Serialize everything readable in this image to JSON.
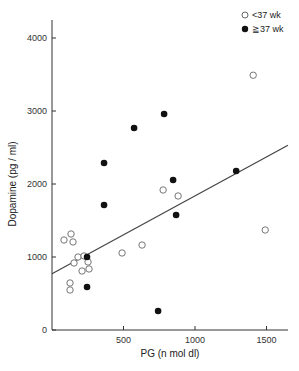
{
  "chart_data": {
    "type": "scatter",
    "title": "",
    "xlabel": "PG (n mol dl)",
    "ylabel": "Dopamine (pg / ml)",
    "xlim": [
      0,
      1650
    ],
    "ylim": [
      0,
      4300
    ],
    "xticks": [
      500,
      1000,
      1500
    ],
    "yticks": [
      0,
      1000,
      2000,
      3000,
      4000
    ],
    "grid": false,
    "legend_position": "top-right",
    "series": [
      {
        "name": "<37 wk",
        "marker": "open-circle",
        "points": [
          [
            1407,
            3490
          ],
          [
            777,
            1918
          ],
          [
            882,
            1836
          ],
          [
            630,
            1164
          ],
          [
            1491,
            1370
          ],
          [
            490,
            1055
          ],
          [
            84,
            1233
          ],
          [
            133,
            1315
          ],
          [
            147,
            1206
          ],
          [
            182,
            1000
          ],
          [
            154,
            918
          ],
          [
            224,
            1014
          ],
          [
            210,
            808
          ],
          [
            126,
            644
          ],
          [
            126,
            548
          ],
          [
            259,
            836
          ],
          [
            252,
            932
          ]
        ]
      },
      {
        "name": "≧37 wk",
        "marker": "filled-circle",
        "points": [
          [
            784,
            2959
          ],
          [
            574,
            2767
          ],
          [
            364,
            2288
          ],
          [
            847,
            2055
          ],
          [
            364,
            1712
          ],
          [
            868,
            1575
          ],
          [
            1288,
            2178
          ],
          [
            245,
            1000
          ],
          [
            245,
            589
          ],
          [
            742,
            260
          ]
        ]
      }
    ],
    "regression_line": {
      "x": [
        0,
        1650
      ],
      "y": [
        770,
        2530
      ]
    }
  },
  "legend": {
    "items": [
      {
        "label": "<37 wk",
        "marker": "open-circle"
      },
      {
        "label": "≧37 wk",
        "marker": "filled-circle"
      }
    ]
  }
}
